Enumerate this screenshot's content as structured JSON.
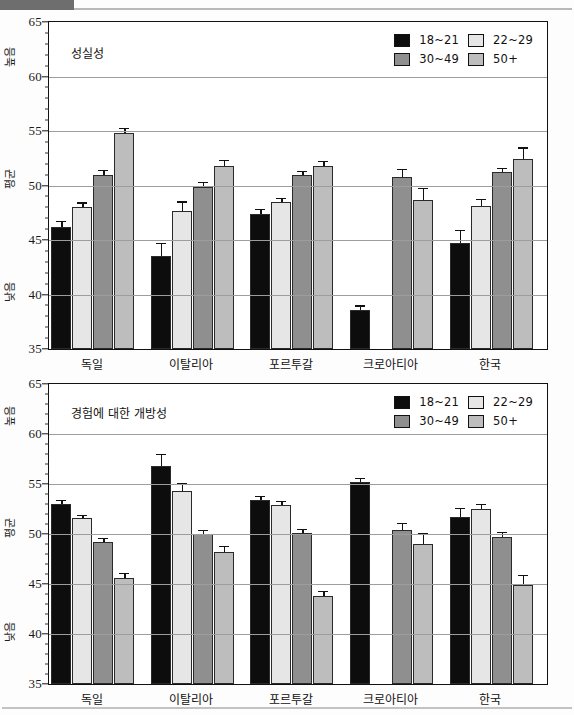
{
  "document": {
    "type": "scanned-figure-page",
    "charts_count": 2
  },
  "legend": {
    "entries": [
      {
        "label": "18~21",
        "color": "#0d0d0d"
      },
      {
        "label": "22~29",
        "color": "#e6e6e6"
      },
      {
        "label": "30~49",
        "color": "#8f8f8f"
      },
      {
        "label": "50+",
        "color": "#bdbdbd"
      }
    ]
  },
  "axis": {
    "y_ticks": [
      "65",
      "60",
      "55",
      "50",
      "45",
      "40",
      "35"
    ],
    "y_band_high": "높음",
    "y_band_mid": "평균",
    "y_band_low": "낮음",
    "categories": [
      "독일",
      "이탈리아",
      "포르투갈",
      "크로아티아",
      "한국"
    ]
  },
  "chart_data": [
    {
      "type": "bar",
      "title": "성실성",
      "xlabel": "",
      "ylabel": "",
      "ylim": [
        35,
        65
      ],
      "ytick_step": 5,
      "grid": true,
      "legend_position": "top-right",
      "categories": [
        "독일",
        "이탈리아",
        "포르투갈",
        "크로아티아",
        "한국"
      ],
      "series": [
        {
          "name": "18~21",
          "color": "#0d0d0d",
          "values": [
            46.2,
            43.5,
            47.4,
            38.6,
            44.7
          ],
          "errors": [
            0.55,
            1.25,
            0.45,
            0.4,
            1.25
          ]
        },
        {
          "name": "22~29",
          "color": "#e6e6e6",
          "values": [
            48.0,
            47.7,
            48.5,
            null,
            48.1
          ],
          "errors": [
            0.45,
            0.85,
            0.35,
            null,
            0.65
          ]
        },
        {
          "name": "30~49",
          "color": "#8f8f8f",
          "values": [
            51.0,
            49.85,
            51.0,
            50.8,
            51.2
          ],
          "errors": [
            0.45,
            0.5,
            0.35,
            0.75,
            0.4
          ]
        },
        {
          "name": "50+",
          "color": "#bdbdbd",
          "values": [
            54.85,
            51.75,
            51.75,
            48.7,
            52.45
          ],
          "errors": [
            0.45,
            0.6,
            0.5,
            1.1,
            1.05
          ]
        }
      ]
    },
    {
      "type": "bar",
      "title": "경험에 대한 개방성",
      "xlabel": "",
      "ylabel": "",
      "ylim": [
        35,
        65
      ],
      "ytick_step": 5,
      "grid": true,
      "legend_position": "top-right",
      "categories": [
        "독일",
        "이탈리아",
        "포르투갈",
        "크로아티아",
        "한국"
      ],
      "series": [
        {
          "name": "18~21",
          "color": "#0d0d0d",
          "values": [
            53.0,
            56.8,
            53.4,
            55.2,
            51.7
          ],
          "errors": [
            0.4,
            1.2,
            0.45,
            0.4,
            0.95
          ]
        },
        {
          "name": "22~29",
          "color": "#e6e6e6",
          "values": [
            51.65,
            54.3,
            52.95,
            null,
            52.5
          ],
          "errors": [
            0.3,
            0.85,
            0.4,
            null,
            0.55
          ]
        },
        {
          "name": "30~49",
          "color": "#8f8f8f",
          "values": [
            49.2,
            50.0,
            50.15,
            50.4,
            49.7
          ],
          "errors": [
            0.4,
            0.45,
            0.4,
            0.7,
            0.5
          ]
        },
        {
          "name": "50+",
          "color": "#bdbdbd",
          "values": [
            45.65,
            48.2,
            43.85,
            49.0,
            44.9
          ],
          "errors": [
            0.5,
            0.6,
            0.45,
            1.1,
            1.05
          ]
        }
      ]
    }
  ]
}
